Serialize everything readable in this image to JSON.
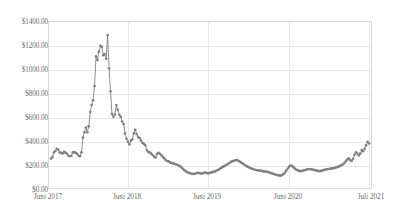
{
  "chart_data": {
    "type": "line",
    "title": "",
    "subtitle": "",
    "xlabel": "",
    "ylabel": "",
    "ylim": [
      0,
      1400
    ],
    "xlim": [
      0,
      213
    ],
    "grid": true,
    "legend": "none",
    "markers": true,
    "series_color": "#808080",
    "ytick_labels": [
      "$1400.00",
      "$1200.00",
      "$1000.00",
      "$800.00",
      "$600.00",
      "$400.00",
      "$200.00",
      "$0.00"
    ],
    "ytick_values": [
      1400,
      1200,
      1000,
      800,
      600,
      400,
      200,
      0
    ],
    "xtick_labels": [
      "Juni 2017",
      "Juni 2018",
      "Juni 2019",
      "Juni 2020",
      "Juli 2021"
    ],
    "xtick_positions": [
      0,
      52,
      104,
      157,
      212
    ],
    "series": [
      {
        "name": "Price",
        "values": [
          248,
          262,
          300,
          312,
          330,
          322,
          300,
          296,
          290,
          304,
          298,
          288,
          272,
          268,
          272,
          300,
          302,
          296,
          288,
          272,
          268,
          300,
          425,
          470,
          510,
          470,
          520,
          640,
          700,
          740,
          860,
          1110,
          1080,
          1150,
          1200,
          1190,
          1120,
          1130,
          1090,
          1290,
          1010,
          815,
          625,
          600,
          620,
          700,
          660,
          618,
          600,
          560,
          540,
          460,
          415,
          390,
          368,
          400,
          410,
          460,
          490,
          455,
          430,
          420,
          400,
          380,
          372,
          360,
          320,
          305,
          300,
          290,
          278,
          265,
          258,
          288,
          296,
          288,
          276,
          262,
          250,
          236,
          228,
          224,
          216,
          212,
          208,
          204,
          200,
          196,
          190,
          182,
          172,
          160,
          150,
          140,
          132,
          128,
          124,
          120,
          118,
          120,
          124,
          128,
          126,
          124,
          122,
          126,
          130,
          128,
          124,
          126,
          130,
          134,
          136,
          140,
          146,
          152,
          160,
          168,
          176,
          182,
          190,
          196,
          204,
          212,
          220,
          226,
          230,
          234,
          236,
          230,
          222,
          214,
          206,
          198,
          190,
          182,
          176,
          170,
          164,
          160,
          156,
          152,
          150,
          148,
          146,
          144,
          142,
          140,
          138,
          136,
          132,
          128,
          124,
          120,
          116,
          112,
          108,
          106,
          104,
          108,
          116,
          128,
          146,
          164,
          180,
          190,
          186,
          176,
          164,
          154,
          148,
          144,
          142,
          144,
          148,
          152,
          156,
          158,
          160,
          158,
          156,
          154,
          150,
          146,
          144,
          142,
          144,
          148,
          152,
          156,
          158,
          160,
          162,
          164,
          166,
          168,
          172,
          176,
          180,
          186,
          192,
          200,
          210,
          224,
          240,
          250,
          236,
          228,
          246,
          280,
          300,
          290,
          275,
          290,
          320,
          310,
          330,
          360,
          390,
          375
        ]
      }
    ]
  }
}
